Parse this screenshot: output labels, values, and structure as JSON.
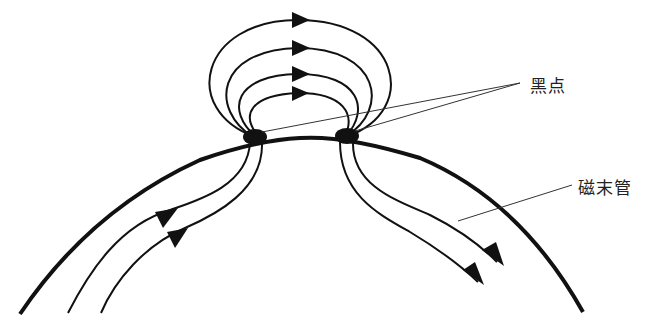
{
  "diagram": {
    "type": "sunspot-magnetic-flux-tube",
    "labels": {
      "sunspot": "黑点",
      "flux_tube": "磁末管"
    },
    "colors": {
      "stroke": "#111111",
      "background": "#ffffff",
      "leader_line": "#333333"
    },
    "elements": {
      "surface_arc": "solar-surface-limb",
      "sunspots": 2,
      "loop_lines": 4,
      "subsurface_lines_left": 2,
      "subsurface_lines_right": 2
    }
  }
}
